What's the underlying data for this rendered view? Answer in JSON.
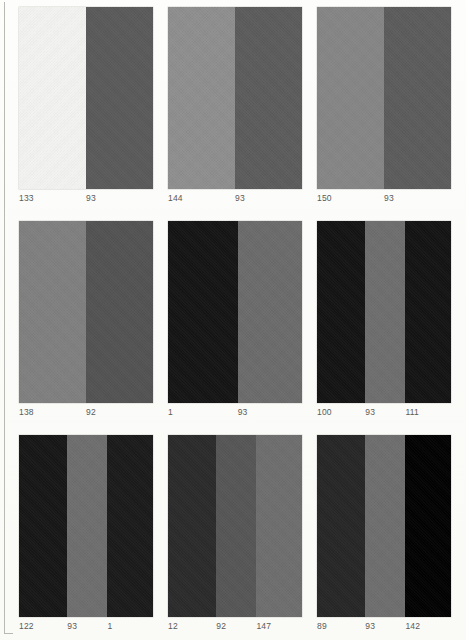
{
  "plate": {
    "title": "Color swatch plate",
    "columns": 3,
    "rows": 3,
    "label_color": "#5a5a57",
    "page_background": "#fcfcfa",
    "rule_color": "#b9b9b4"
  },
  "blocks": [
    {
      "id": "block-1",
      "row": 1,
      "col": 1,
      "bands": [
        {
          "label": "133",
          "color": "#f2f2f0",
          "width_pct": 50
        },
        {
          "label": "93",
          "color": "#5a5a5a",
          "width_pct": 50
        }
      ]
    },
    {
      "id": "block-2",
      "row": 1,
      "col": 2,
      "bands": [
        {
          "label": "144",
          "color": "#8e8e8e",
          "width_pct": 50
        },
        {
          "label": "93",
          "color": "#5c5c5c",
          "width_pct": 50
        }
      ]
    },
    {
      "id": "block-3",
      "row": 1,
      "col": 3,
      "bands": [
        {
          "label": "150",
          "color": "#858585",
          "width_pct": 50
        },
        {
          "label": "93",
          "color": "#5c5c5c",
          "width_pct": 50
        }
      ]
    },
    {
      "id": "block-4",
      "row": 2,
      "col": 1,
      "bands": [
        {
          "label": "138",
          "color": "#7f7f7f",
          "width_pct": 50
        },
        {
          "label": "92",
          "color": "#535353",
          "width_pct": 50
        }
      ]
    },
    {
      "id": "block-5",
      "row": 2,
      "col": 2,
      "bands": [
        {
          "label": "1",
          "color": "#151515",
          "width_pct": 52
        },
        {
          "label": "93",
          "color": "#6b6b6b",
          "width_pct": 48
        }
      ]
    },
    {
      "id": "block-6",
      "row": 2,
      "col": 3,
      "bands": [
        {
          "label": "100",
          "color": "#141414",
          "width_pct": 36
        },
        {
          "label": "93",
          "color": "#6e6e6e",
          "width_pct": 30
        },
        {
          "label": "111",
          "color": "#141414",
          "width_pct": 34
        }
      ]
    },
    {
      "id": "block-7",
      "row": 3,
      "col": 1,
      "bands": [
        {
          "label": "122",
          "color": "#171717",
          "width_pct": 36
        },
        {
          "label": "93",
          "color": "#6e6e6e",
          "width_pct": 30
        },
        {
          "label": "1",
          "color": "#1b1b1b",
          "width_pct": 34
        }
      ]
    },
    {
      "id": "block-8",
      "row": 3,
      "col": 2,
      "bands": [
        {
          "label": "12",
          "color": "#2b2b2b",
          "width_pct": 36
        },
        {
          "label": "92",
          "color": "#565656",
          "width_pct": 30
        },
        {
          "label": "147",
          "color": "#6e6e6e",
          "width_pct": 34
        }
      ]
    },
    {
      "id": "block-9",
      "row": 3,
      "col": 3,
      "bands": [
        {
          "label": "89",
          "color": "#272727",
          "width_pct": 36
        },
        {
          "label": "93",
          "color": "#6e6e6e",
          "width_pct": 30
        },
        {
          "label": "142",
          "color": "#030303",
          "width_pct": 34
        }
      ]
    }
  ]
}
